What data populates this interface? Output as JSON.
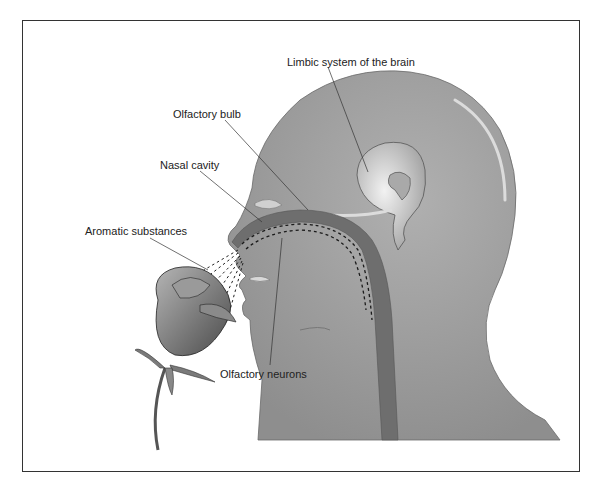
{
  "diagram": {
    "labels": {
      "limbic": "Limbic system of the brain",
      "bulb": "Olfactory bulb",
      "cavity": "Nasal cavity",
      "aromatic": "Aromatic substances",
      "neurons": "Olfactory neurons"
    },
    "colors": {
      "head_fill": "#9a9a9a",
      "head_highlight": "#c8c8c8",
      "pathway": "#6e6e6e",
      "leader_line": "#333333",
      "frame": "#333333"
    }
  }
}
